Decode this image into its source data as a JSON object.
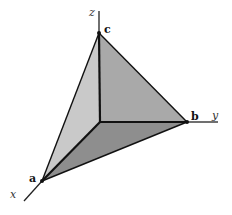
{
  "diagram": {
    "type": "3d-tetrahedron-coordinate-axes",
    "axes": {
      "x": {
        "label": "x"
      },
      "y": {
        "label": "y"
      },
      "z": {
        "label": "z"
      }
    },
    "vertices": {
      "a": {
        "label": "a",
        "axis": "x"
      },
      "b": {
        "label": "b",
        "axis": "y"
      },
      "c": {
        "label": "c",
        "axis": "z"
      }
    },
    "faces": [
      {
        "name": "xz-face",
        "color": "#c9c9c9"
      },
      {
        "name": "yz-face",
        "color": "#a9a9a9"
      },
      {
        "name": "xy-face",
        "color": "#8e8e8e"
      }
    ],
    "edge_color": "#111111",
    "axis_color": "#222222"
  }
}
